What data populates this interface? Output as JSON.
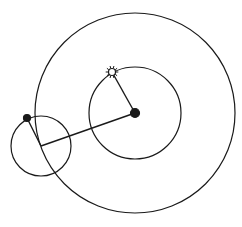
{
  "diagram": {
    "type": "epicycle-deferent",
    "stroke_color": "#1a1a1a",
    "background": "#ffffff",
    "deferent_circle": {
      "cx": 135,
      "cy": 113,
      "r": 100
    },
    "inner_circle": {
      "cx": 135,
      "cy": 113,
      "r": 46
    },
    "center_body": {
      "cx": 135,
      "cy": 113,
      "r": 4.5
    },
    "sun": {
      "cx": 112,
      "cy": 72,
      "r": 3.5,
      "rays": 10
    },
    "epicycle_circle": {
      "cx": 41,
      "cy": 146,
      "r": 30
    },
    "planet": {
      "cx": 27,
      "cy": 118,
      "r": 3.5
    },
    "lines": [
      {
        "name": "center-to-sun",
        "x1": 135,
        "y1": 113,
        "x2": 112,
        "y2": 72
      },
      {
        "name": "center-to-epicycle-center",
        "x1": 135,
        "y1": 113,
        "x2": 41,
        "y2": 146
      },
      {
        "name": "epicycle-radius",
        "x1": 41,
        "y1": 146,
        "x2": 27,
        "y2": 118
      }
    ]
  }
}
